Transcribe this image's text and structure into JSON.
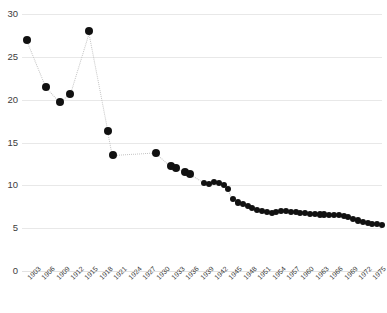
{
  "chart_data": {
    "type": "scatter",
    "title": "",
    "subtitle": "",
    "xlabel": "",
    "ylabel": "",
    "xlim": [
      1902,
      1977
    ],
    "ylim": [
      0,
      30
    ],
    "grid": true,
    "legend": null,
    "marker_color": "#111111",
    "connector_color": "#c4c4c4",
    "connector_style": "dotted",
    "y_ticks": [
      0,
      5,
      10,
      15,
      20,
      25,
      30
    ],
    "y_tick_labels": [
      "0",
      "5",
      "10",
      "15",
      "20",
      "25",
      "30"
    ],
    "x_ticks": [
      1903,
      1906,
      1909,
      1912,
      1915,
      1918,
      1921,
      1924,
      1927,
      1930,
      1933,
      1936,
      1939,
      1942,
      1945,
      1948,
      1951,
      1954,
      1957,
      1960,
      1963,
      1966,
      1969,
      1972,
      1975
    ],
    "x_tick_labels": [
      "1903",
      "1906",
      "1909",
      "1912",
      "1915",
      "1918",
      "1921",
      "1924",
      "1927",
      "1930",
      "1933",
      "1936",
      "1939",
      "1942",
      "1945",
      "1948",
      "1951",
      "1954",
      "1957",
      "1960",
      "1963",
      "1966",
      "1969",
      "1972",
      "1975"
    ],
    "x": [
      1903,
      1907,
      1910,
      1912,
      1916,
      1920,
      1921,
      1930,
      1933,
      1934,
      1936,
      1937,
      1940,
      1941,
      1942,
      1943,
      1944,
      1945,
      1946,
      1947,
      1948,
      1949,
      1950,
      1951,
      1952,
      1953,
      1954,
      1955,
      1956,
      1957,
      1958,
      1959,
      1960,
      1961,
      1962,
      1963,
      1964,
      1965,
      1966,
      1967,
      1968,
      1969,
      1970,
      1971,
      1972,
      1973,
      1974,
      1975,
      1976,
      1977
    ],
    "values": [
      27.0,
      21.5,
      19.7,
      20.7,
      28.0,
      16.4,
      13.5,
      13.8,
      12.3,
      12.0,
      11.5,
      11.3,
      10.3,
      10.2,
      10.4,
      10.3,
      10.0,
      9.6,
      8.4,
      8.0,
      7.8,
      7.6,
      7.4,
      7.1,
      7.0,
      6.9,
      6.8,
      6.9,
      7.0,
      7.0,
      6.9,
      6.9,
      6.8,
      6.8,
      6.7,
      6.7,
      6.6,
      6.6,
      6.5,
      6.5,
      6.5,
      6.4,
      6.3,
      6.1,
      5.9,
      5.7,
      5.6,
      5.5,
      5.5,
      5.4
    ]
  }
}
